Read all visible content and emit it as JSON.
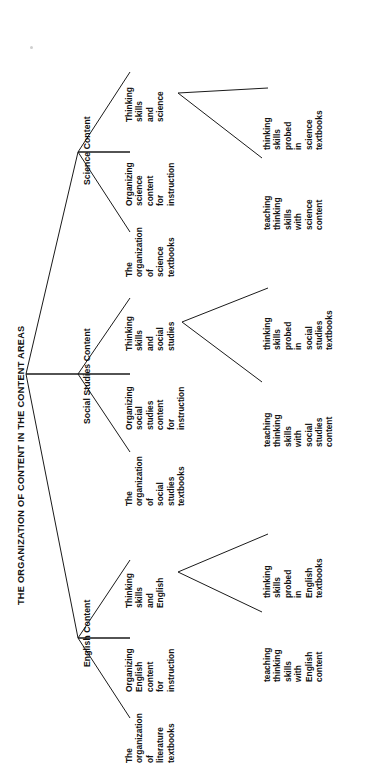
{
  "diagram": {
    "type": "tree",
    "orientation": "rotated-90-ccw",
    "title": "THE ORGANIZATION OF CONTENT IN THE CONTENT AREAS",
    "root": {
      "label": "THE ORGANIZATION OF CONTENT IN THE CONTENT AREAS"
    },
    "branches": [
      {
        "id": "english",
        "label": "English Content",
        "children": [
          {
            "id": "english-textbook-organization",
            "lines": [
              "The",
              "organization",
              "of",
              "literature",
              "textbooks"
            ],
            "text": "The organization of literature textbooks"
          },
          {
            "id": "english-organizing-content",
            "lines": [
              "Organizing",
              "English",
              "content",
              "for",
              "instruction"
            ],
            "text": "Organizing English content for instruction"
          },
          {
            "id": "english-thinking-skills",
            "lines": [
              "Thinking",
              "skills",
              "and",
              "English"
            ],
            "text": "Thinking skills and English",
            "children": [
              {
                "id": "english-skills-probed",
                "lines": [
                  "thinking",
                  "skills",
                  "probed",
                  "in",
                  "English",
                  "textbooks"
                ],
                "text": "thinking skills probed in English textbooks"
              },
              {
                "id": "english-teaching-skills",
                "lines": [
                  "teaching",
                  "thinking",
                  "skills",
                  "with",
                  "English",
                  "content"
                ],
                "text": "teaching thinking skills with English content"
              }
            ]
          }
        ]
      },
      {
        "id": "social-studies",
        "label": "Social Studies Content",
        "children": [
          {
            "id": "social-textbook-organization",
            "lines": [
              "The",
              "organization",
              "of",
              "social",
              "studies",
              "textbooks"
            ],
            "text": "The organization of social studies textbooks"
          },
          {
            "id": "social-organizing-content",
            "lines": [
              "Organizing",
              "social",
              "studies",
              "content",
              "for",
              "instruction"
            ],
            "text": "Organizing social studies content for instruction"
          },
          {
            "id": "social-thinking-skills",
            "lines": [
              "Thinking",
              "skills",
              "and",
              "social",
              "studies"
            ],
            "text": "Thinking skills and social studies",
            "children": [
              {
                "id": "social-skills-probed",
                "lines": [
                  "thinking",
                  "skills",
                  "probed",
                  "in",
                  "social",
                  "studies",
                  "textbooks"
                ],
                "text": "thinking skills probed in social studies textbooks"
              },
              {
                "id": "social-teaching-skills",
                "lines": [
                  "teaching",
                  "thinking",
                  "skills",
                  "with",
                  "social",
                  "studies",
                  "content"
                ],
                "text": "teaching thinking skills with social studies content"
              }
            ]
          }
        ]
      },
      {
        "id": "science",
        "label": "Science Content",
        "children": [
          {
            "id": "science-textbook-organization",
            "lines": [
              "The",
              "organization",
              "of",
              "science",
              "textbooks"
            ],
            "text": "The organization of science textbooks"
          },
          {
            "id": "science-organizing-content",
            "lines": [
              "Organizing",
              "science",
              "content",
              "for",
              "instruction"
            ],
            "text": "Organizing science content for instruction"
          },
          {
            "id": "science-thinking-skills",
            "lines": [
              "Thinking",
              "skills",
              "and",
              "science"
            ],
            "text": "Thinking skills and science",
            "children": [
              {
                "id": "science-skills-probed",
                "lines": [
                  "thinking",
                  "skills",
                  "probed",
                  "in",
                  "science",
                  "textbooks"
                ],
                "text": "thinking skills probed in science textbooks"
              },
              {
                "id": "science-teaching-skills",
                "lines": [
                  "teaching",
                  "thinking",
                  "skills",
                  "with",
                  "science",
                  "content"
                ],
                "text": "teaching thinking skills with science content"
              }
            ]
          }
        ]
      }
    ],
    "colors": {
      "line": "#1a1a1a",
      "text": "#111111",
      "background": "#ffffff"
    }
  }
}
